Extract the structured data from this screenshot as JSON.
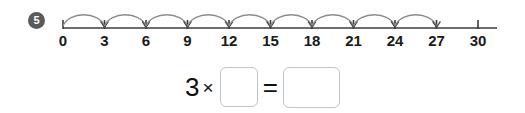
{
  "page": {
    "background_color": "#ffffff",
    "width": 525,
    "height": 113
  },
  "question": {
    "number_badge": "5",
    "badge_bg_color": "#5a5a5a",
    "badge_text_color": "#ffffff"
  },
  "number_line": {
    "tick_labels": [
      "0",
      "3",
      "6",
      "9",
      "12",
      "15",
      "18",
      "21",
      "24",
      "27",
      "30"
    ],
    "tick_values": [
      0,
      3,
      6,
      9,
      12,
      15,
      18,
      21,
      24,
      27,
      30
    ],
    "interval": 3,
    "min": 0,
    "max": 30,
    "line_color": "#3c3c3c",
    "label_color": "#1a1a1a",
    "arc_color": "#8c8c8c",
    "hops": [
      {
        "from": 0,
        "to": 3
      },
      {
        "from": 3,
        "to": 6
      },
      {
        "from": 6,
        "to": 9
      },
      {
        "from": 9,
        "to": 12
      },
      {
        "from": 12,
        "to": 15
      },
      {
        "from": 15,
        "to": 18
      },
      {
        "from": 18,
        "to": 21
      },
      {
        "from": 21,
        "to": 24
      },
      {
        "from": 24,
        "to": 27
      }
    ],
    "hop_count": 9
  },
  "equation": {
    "multiplicand": "3",
    "times_symbol": "×",
    "equals_symbol": "=",
    "factor_box_value": "",
    "factor_box_placeholder": "",
    "product_box_value": "",
    "product_box_placeholder": "",
    "box_border_color": "#c4c4c4"
  },
  "chart_data": {
    "type": "line",
    "title": "",
    "xlabel": "",
    "ylabel": "",
    "xlim": [
      0,
      30
    ],
    "grid": false,
    "categories": [
      "0",
      "3",
      "6",
      "9",
      "12",
      "15",
      "18",
      "21",
      "24",
      "27",
      "30"
    ],
    "values": [
      0,
      3,
      6,
      9,
      12,
      15,
      18,
      21,
      24,
      27,
      30
    ],
    "annotations": [
      "skip-count hops of 3 from 0 to 27",
      "9 hops drawn"
    ]
  }
}
